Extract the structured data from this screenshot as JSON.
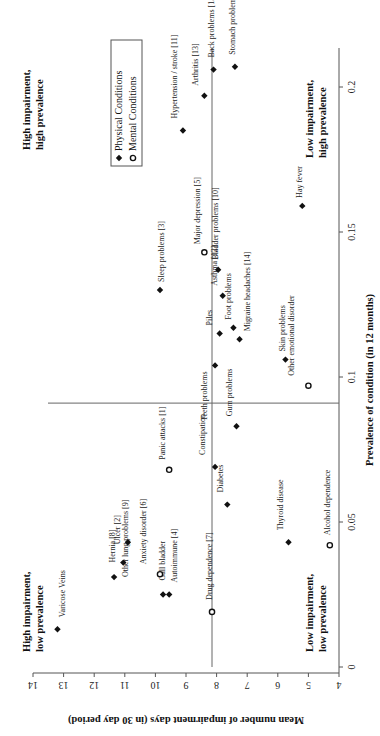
{
  "chart_data": {
    "type": "scatter",
    "orientation": "rotated-90-ccw",
    "xlabel": "Prevalence of condition (in 12 months)",
    "ylabel": "Mean number of impairment days (in 30 day period)",
    "xlim": [
      0,
      0.205
    ],
    "ylim": [
      4,
      14
    ],
    "x_ticks": [
      0,
      0.05,
      0.1,
      0.15,
      0.2
    ],
    "x_tick_labels": [
      "0",
      "0.05",
      "0.1",
      "0.15",
      "0.2"
    ],
    "y_ticks": [
      4,
      5,
      6,
      7,
      8,
      9,
      10,
      11,
      12,
      13,
      14
    ],
    "y_tick_labels": [
      "4",
      "5",
      "6",
      "7",
      "8",
      "9",
      "10",
      "11",
      "12",
      "13",
      "14"
    ],
    "divider_x": 0.091,
    "divider_y": 8.15,
    "legend": [
      {
        "name": "Physical Conditions",
        "marker": "diamond"
      },
      {
        "name": "Mental Conditions",
        "marker": "circle"
      }
    ],
    "quadrant_labels": [
      {
        "lines": [
          "High impairment,",
          "high prevalence"
        ],
        "pos": "top-high"
      },
      {
        "lines": [
          "High impairment,",
          "low prevalence"
        ],
        "pos": "top-low"
      },
      {
        "lines": [
          "Low impairment,",
          "high prevalence"
        ],
        "pos": "bottom-high"
      },
      {
        "lines": [
          "Low impairment,",
          "low prevalence"
        ],
        "pos": "bottom-low"
      }
    ],
    "series": [
      {
        "name": "Physical Conditions",
        "marker": "diamond",
        "points": [
          {
            "label": "Varicose Veins",
            "x": 0.013,
            "y": 13.2
          },
          {
            "label": "Other lung problems [9]",
            "x": 0.031,
            "y": 11.35
          },
          {
            "label": "Hernia [8]",
            "x": 0.036,
            "y": 11.05
          },
          {
            "label": "Ulcer [2]",
            "x": 0.043,
            "y": 10.9
          },
          {
            "label": "Autoimmune [4]",
            "x": 0.025,
            "y": 9.75
          },
          {
            "label": "Gall bladder",
            "x": 0.025,
            "y": 9.55
          },
          {
            "label": "Constipation",
            "x": 0.069,
            "y": 8.05
          },
          {
            "label": "Diabetes",
            "x": 0.056,
            "y": 7.65
          },
          {
            "label": "Gum problems",
            "x": 0.083,
            "y": 7.35
          },
          {
            "label": "Thyroid disease",
            "x": 0.043,
            "y": 5.65
          },
          {
            "label": "Teeth problems",
            "x": 0.104,
            "y": 8.05
          },
          {
            "label": "Piles",
            "x": 0.115,
            "y": 7.9
          },
          {
            "label": "Foot problems",
            "x": 0.117,
            "y": 7.45
          },
          {
            "label": "Migraine headaches [14]",
            "x": 0.113,
            "y": 7.25
          },
          {
            "label": "Asthma [12]",
            "x": 0.128,
            "y": 7.8
          },
          {
            "label": "Bladder problems [10]",
            "x": 0.137,
            "y": 7.95
          },
          {
            "label": "Sleep problems [3]",
            "x": 0.13,
            "y": 9.85
          },
          {
            "label": "Skin problems",
            "x": 0.106,
            "y": 5.75
          },
          {
            "label": "Hay fever",
            "x": 0.159,
            "y": 5.2
          },
          {
            "label": "Hypertension / stroke [11]",
            "x": 0.185,
            "y": 9.1
          },
          {
            "label": "Arthritis [13]",
            "x": 0.197,
            "y": 8.4
          },
          {
            "label": "Back problems [15]",
            "x": 0.206,
            "y": 8.1
          },
          {
            "label": "Stomach problems",
            "x": 0.207,
            "y": 7.4
          }
        ]
      },
      {
        "name": "Mental Conditions",
        "marker": "circle",
        "points": [
          {
            "label": "Anxiety disorder [6]",
            "x": 0.032,
            "y": 9.85
          },
          {
            "label": "Panic attacks [1]",
            "x": 0.068,
            "y": 9.55
          },
          {
            "label": "Drug dependence [7]",
            "x": 0.019,
            "y": 8.15
          },
          {
            "label": "Alcohol dependence",
            "x": 0.042,
            "y": 4.3
          },
          {
            "label": "Major depression [5]",
            "x": 0.143,
            "y": 8.4
          },
          {
            "label": "Other emotional disorder",
            "x": 0.097,
            "y": 5.0
          }
        ]
      }
    ]
  },
  "text": {
    "xlabel": "Prevalence of condition (in 12 months)",
    "ylabel": "Mean number of impairment days (in 30 day period)",
    "legend_physical": "Physical Conditions",
    "legend_mental": "Mental Conditions",
    "q_hh_1": "High impairment,",
    "q_hh_2": "high prevalence",
    "q_hl_1": "High impairment,",
    "q_hl_2": "low prevalence",
    "q_lh_1": "Low impairment,",
    "q_lh_2": "high prevalence",
    "q_ll_1": "Low impairment,",
    "q_ll_2": "low prevalence"
  },
  "layout": {
    "labels": {
      "Varicose Veins": [
        8,
        12,
        "start"
      ],
      "Other lung problems [9]": [
        14,
        0,
        "start"
      ],
      "Hernia [8]": [
        -8,
        0,
        "start"
      ],
      "Ulcer [2]": [
        -8,
        -2,
        "start"
      ],
      "Autoimmune [4]": [
        14,
        12,
        "start"
      ],
      "Gall bladder": [
        -4,
        14,
        "start"
      ],
      "Constipation": [
        -10,
        12,
        "start"
      ],
      "Diabetes": [
        -4,
        12,
        "start"
      ],
      "Gum problems": [
        -4,
        10,
        "start"
      ],
      "Thyroid disease": [
        -6,
        12,
        "start"
      ],
      "Teeth problems": [
        -8,
        -6,
        "end"
      ],
      "Piles": [
        -8,
        8,
        "start"
      ],
      "Foot problems": [
        -2,
        8,
        "start"
      ],
      "Migraine headaches [14]": [
        10,
        8,
        "start"
      ],
      "Asthma [12]": [
        -6,
        10,
        "start"
      ],
      "Bladder problems [10]": [
        0,
        10,
        "start"
      ],
      "Sleep problems [3]": [
        4,
        8,
        "start"
      ],
      "Skin problems": [
        0,
        8,
        "start"
      ],
      "Hay fever": [
        0,
        8,
        "start"
      ],
      "Hypertension / stroke [11]": [
        -6,
        12,
        "start"
      ],
      "Arthritis [13]": [
        -6,
        10,
        "start"
      ],
      "Back problems [15]": [
        0,
        12,
        "start"
      ],
      "Stomach problems": [
        0,
        12,
        "start"
      ],
      "Anxiety disorder [6]": [
        -14,
        10,
        "start"
      ],
      "Panic attacks [1]": [
        -4,
        10,
        "start"
      ],
      "Drug dependence [7]": [
        0,
        12,
        "start"
      ],
      "Alcohol dependence": [
        0,
        10,
        "start"
      ],
      "Major depression [5]": [
        -4,
        8,
        "start"
      ],
      "Other emotional disorder": [
        -14,
        10,
        "start"
      ]
    }
  }
}
